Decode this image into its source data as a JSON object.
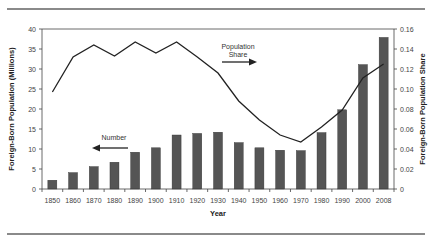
{
  "chart_data": {
    "type": "bar+line",
    "title": "",
    "xlabel": "Year",
    "ylabel_left": "Foreign-Born Population (Millions)",
    "ylabel_right": "Foreign-Born Population Share",
    "categories": [
      "1850",
      "1860",
      "1870",
      "1880",
      "1890",
      "1900",
      "1910",
      "1920",
      "1930",
      "1940",
      "1950",
      "1960",
      "1970",
      "1980",
      "1990",
      "2000",
      "2008"
    ],
    "series": [
      {
        "name": "Number",
        "type": "bar",
        "axis": "left",
        "color": "#555555",
        "values": [
          2.2,
          4.1,
          5.6,
          6.7,
          9.2,
          10.3,
          13.5,
          13.9,
          14.2,
          11.6,
          10.3,
          9.7,
          9.6,
          14.1,
          19.8,
          31.1,
          37.9
        ]
      },
      {
        "name": "Population Share",
        "type": "line",
        "axis": "right",
        "color": "#222222",
        "values": [
          0.097,
          0.132,
          0.144,
          0.133,
          0.147,
          0.136,
          0.147,
          0.132,
          0.116,
          0.088,
          0.069,
          0.054,
          0.047,
          0.062,
          0.079,
          0.111,
          0.125
        ]
      }
    ],
    "ylim_left": [
      0,
      40
    ],
    "yticks_left": [
      "0",
      "5",
      "10",
      "15",
      "20",
      "25",
      "30",
      "35",
      "40"
    ],
    "ylim_right": [
      0,
      0.16
    ],
    "yticks_right": [
      "0",
      "0.02",
      "0.04",
      "0.06",
      "0.08",
      "0.10",
      "0.12",
      "0.14",
      "0.16"
    ],
    "grid": false,
    "annotations": [
      {
        "text": "Number",
        "arrow": "left"
      },
      {
        "text_line1": "Population",
        "text_line2": "Share",
        "arrow": "right"
      }
    ]
  },
  "labels": {
    "xlabel": "Year",
    "ylabel_left": "Foreign-Born Population (Millions)",
    "ylabel_right": "Foreign-Born Population Share",
    "annot_number": "Number",
    "annot_share_1": "Population",
    "annot_share_2": "Share"
  }
}
